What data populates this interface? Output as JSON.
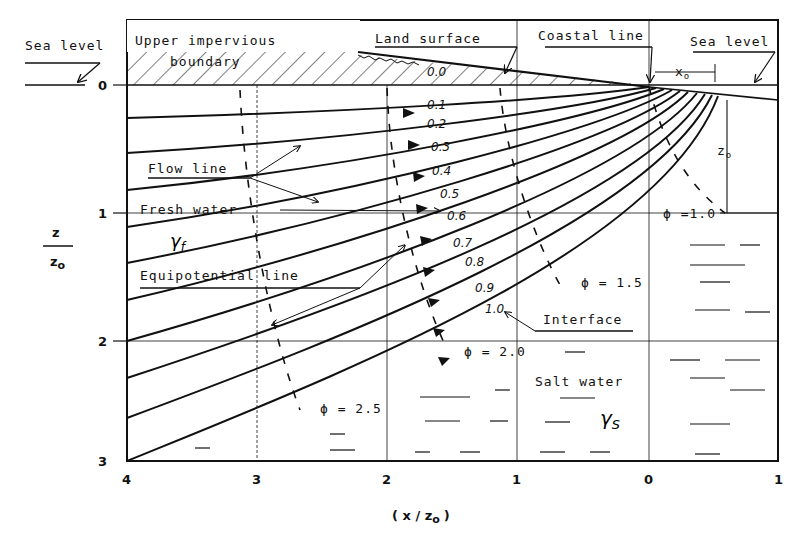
{
  "labels": {
    "sea_level_left": "Sea level",
    "upper_impervious_1": "Upper impervious",
    "upper_impervious_2": "boundary",
    "land_surface": "Land surface",
    "coastal_line": "Coastal line",
    "sea_level_right": "Sea level",
    "x0": "x",
    "x0_sub": "o",
    "z0": "z",
    "z0_sub": "o",
    "flow_line": "Flow line",
    "fresh_water": "Fresh water",
    "gamma_f": "γ",
    "gamma_f_sub": "f",
    "equipotential_line": "Equipotential line",
    "interface": "Interface",
    "salt_water": "Salt water",
    "gamma_s": "γ",
    "gamma_s_sub": "S",
    "phi_10": "ϕ =1.0",
    "phi_15": "ϕ = 1.5",
    "phi_20": "ϕ = 2.0",
    "phi_25": "ϕ = 2.5"
  },
  "axes": {
    "y_label_num": "z",
    "y_label_den": "z",
    "y_label_den_sub": "o",
    "x_label": "( x / z",
    "x_label_sub": "o",
    "x_label_close": ")",
    "y_ticks": [
      "0",
      "1",
      "2",
      "3"
    ],
    "x_ticks": [
      "4",
      "3",
      "2",
      "1",
      "0",
      "1"
    ]
  },
  "flow_line_values": [
    "0.0",
    "0.1",
    "0.2",
    "0.3",
    "0.4",
    "0.5",
    "0.6",
    "0.7",
    "0.8",
    "0.9",
    "1.0"
  ],
  "colors": {
    "ink": "#111111",
    "paper": "#ffffff"
  }
}
